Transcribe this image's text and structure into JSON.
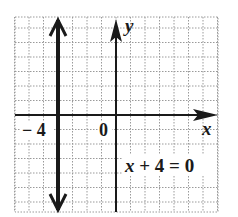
{
  "chart_data": {
    "type": "line",
    "title": "",
    "equation": "x + 4 = 0",
    "xlabel": "x",
    "ylabel": "y",
    "tick_labels": [
      {
        "value": -4,
        "label": "− 4"
      },
      {
        "value": 0,
        "label": "0"
      }
    ],
    "xlim": [
      -7,
      7
    ],
    "ylim": [
      -7,
      7
    ],
    "grid": true,
    "series": [
      {
        "name": "x + 4 = 0",
        "kind": "vertical_line",
        "x": -4,
        "y_range": [
          -7,
          7
        ],
        "arrows": "both"
      }
    ]
  },
  "colors": {
    "ink": "#1a1a1a",
    "grid": "#9a9a9a",
    "background": "#ffffff"
  },
  "labels": {
    "y_axis": "y",
    "x_axis": "x",
    "tick_neg4": "− 4",
    "tick_0": "0",
    "equation": "x + 4 = 0"
  }
}
